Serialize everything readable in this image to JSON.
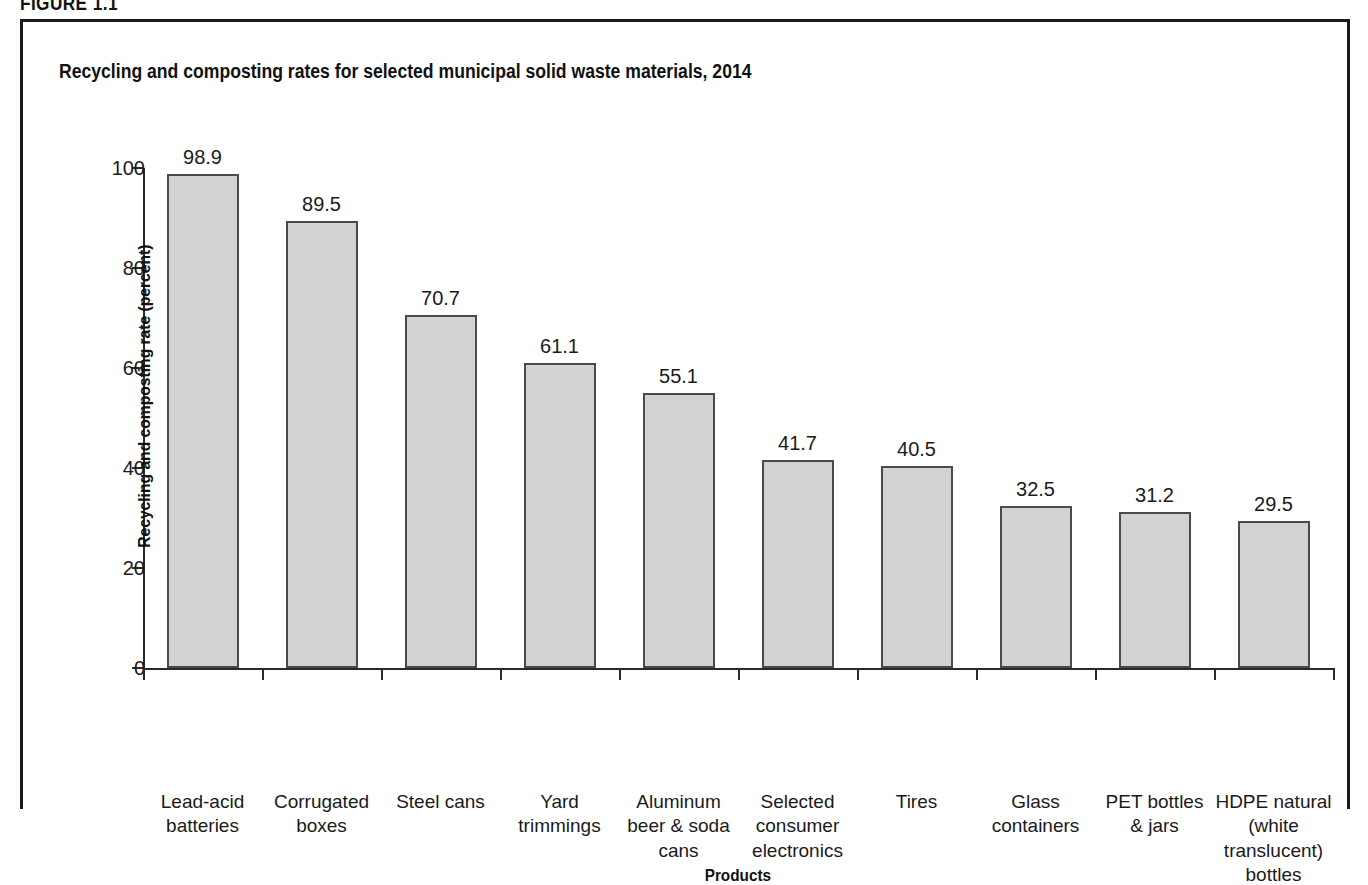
{
  "figure": {
    "caption": "FIGURE 1.1",
    "title": "Recycling and composting rates for selected municipal solid waste materials, 2014"
  },
  "chart_data": {
    "type": "bar",
    "title": "Recycling and composting rates for selected municipal solid waste materials, 2014",
    "xlabel": "Products",
    "ylabel": "Recycling and composting rate (percent)",
    "ylim": [
      0,
      100
    ],
    "yticks": [
      0,
      20,
      40,
      60,
      80,
      100
    ],
    "ytick_labels": [
      "0",
      "20",
      "40",
      "60",
      "80",
      "100"
    ],
    "grid": false,
    "legend": "none",
    "bar_fill_color": "#d2d2d2",
    "bar_border_color": "#4a4a4a",
    "categories": [
      "Lead-acid batteries",
      "Corrugated boxes",
      "Steel cans",
      "Yard trimmings",
      "Aluminum beer & soda cans",
      "Selected consumer electronics",
      "Tires",
      "Glass containers",
      "PET bottles & jars",
      "HDPE natural (white translucent) bottles"
    ],
    "category_label_lines": [
      [
        "Lead-acid",
        "batteries"
      ],
      [
        "Corrugated",
        "boxes"
      ],
      [
        "Steel cans"
      ],
      [
        "Yard",
        "trimmings"
      ],
      [
        "Aluminum",
        "beer & soda",
        "cans"
      ],
      [
        "Selected",
        "consumer",
        "electronics"
      ],
      [
        "Tires"
      ],
      [
        "Glass",
        "containers"
      ],
      [
        "PET bottles",
        "& jars"
      ],
      [
        "HDPE natural",
        "(white translucent)",
        "bottles"
      ]
    ],
    "values": [
      98.9,
      89.5,
      70.7,
      61.1,
      55.1,
      41.7,
      40.5,
      32.5,
      31.2,
      29.5
    ],
    "value_labels": [
      "98.9",
      "89.5",
      "70.7",
      "61.1",
      "55.1",
      "41.7",
      "40.5",
      "32.5",
      "31.2",
      "29.5"
    ]
  }
}
